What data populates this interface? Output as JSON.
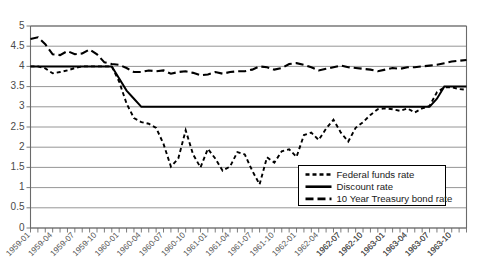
{
  "chart_data": {
    "type": "line",
    "title": "",
    "subtitle": "",
    "xlabel": "",
    "ylabel": "",
    "grid": true,
    "legend_position": "bottom-right",
    "ylim": [
      0,
      5
    ],
    "ytick_labels": [
      "0",
      "0.5",
      "1",
      "1.5",
      "2",
      "2.5",
      "3",
      "3.5",
      "4",
      "4.5",
      "5"
    ],
    "ytick_values": [
      0,
      0.5,
      1,
      1.5,
      2,
      2.5,
      3,
      3.5,
      4,
      4.5,
      5
    ],
    "x": [
      "1959-01",
      "1959-02",
      "1959-03",
      "1959-04",
      "1959-05",
      "1959-06",
      "1959-07",
      "1959-08",
      "1959-09",
      "1959-10",
      "1959-11",
      "1959-12",
      "1960-01",
      "1960-02",
      "1960-03",
      "1960-04",
      "1960-05",
      "1960-06",
      "1960-07",
      "1960-08",
      "1960-09",
      "1960-10",
      "1960-11",
      "1960-12",
      "1961-01",
      "1961-02",
      "1961-03",
      "1961-04",
      "1961-05",
      "1961-06",
      "1961-07",
      "1961-08",
      "1961-09",
      "1961-10",
      "1961-11",
      "1961-12",
      "1962-01",
      "1962-02",
      "1962-03",
      "1962-04",
      "1962-05",
      "1962-06",
      "1962-07",
      "1962-08",
      "1962-09",
      "1962-10",
      "1962-11",
      "1962-12",
      "1963-01",
      "1963-02",
      "1963-03",
      "1963-04",
      "1963-05",
      "1963-06",
      "1963-07",
      "1963-08",
      "1963-09",
      "1963-10",
      "1963-11",
      "1963-12"
    ],
    "xtick_labels": [
      "1959-01",
      "1959-04",
      "1959-07",
      "1959-10",
      "1960-01",
      "1960-04",
      "1960-07",
      "1960-10",
      "1961-01",
      "1961-04",
      "1961-07",
      "1961-10",
      "1962-01",
      "1962-04",
      "1962-07",
      "1962-10",
      "1963-01",
      "1963-04",
      "1963-07",
      "1963-10",
      "1962-07",
      "1962-10",
      "1963-01",
      "1963-04",
      "1963-07",
      "1963-10"
    ],
    "xtick_indices": [
      0,
      3,
      6,
      9,
      12,
      15,
      18,
      21,
      24,
      27,
      30,
      33,
      36,
      39,
      42,
      45,
      48,
      51,
      54,
      57,
      42,
      45,
      48,
      51,
      54,
      57
    ],
    "series": [
      {
        "name": "Federal funds rate",
        "dash": "short",
        "dash_pattern": "4,3",
        "width": 1.9,
        "values": [
          4.0,
          4.0,
          3.95,
          3.83,
          3.86,
          3.9,
          3.96,
          4.0,
          4.0,
          4.0,
          4.0,
          4.0,
          3.62,
          3.08,
          2.72,
          2.62,
          2.58,
          2.48,
          2.08,
          1.52,
          1.72,
          2.42,
          1.82,
          1.5,
          1.96,
          1.72,
          1.42,
          1.52,
          1.88,
          1.82,
          1.42,
          1.08,
          1.75,
          1.62,
          1.9,
          1.95,
          1.76,
          2.3,
          2.36,
          2.18,
          2.46,
          2.68,
          2.36,
          2.14,
          2.48,
          2.62,
          2.8,
          2.94,
          2.96,
          2.94,
          2.9,
          2.96,
          2.86,
          2.96,
          3.02,
          3.36,
          3.48,
          3.48,
          3.44,
          3.42
        ]
      },
      {
        "name": "Discount rate",
        "dash": "solid",
        "dash_pattern": "",
        "width": 2.0,
        "values": [
          4.0,
          4.0,
          4.0,
          4.0,
          4.0,
          4.0,
          4.0,
          4.0,
          4.0,
          4.0,
          4.0,
          4.0,
          3.7,
          3.4,
          3.2,
          3.0,
          3.0,
          3.0,
          3.0,
          3.0,
          3.0,
          3.0,
          3.0,
          3.0,
          3.0,
          3.0,
          3.0,
          3.0,
          3.0,
          3.0,
          3.0,
          3.0,
          3.0,
          3.0,
          3.0,
          3.0,
          3.0,
          3.0,
          3.0,
          3.0,
          3.0,
          3.0,
          3.0,
          3.0,
          3.0,
          3.0,
          3.0,
          3.0,
          3.0,
          3.0,
          3.0,
          3.0,
          3.0,
          3.0,
          3.0,
          3.2,
          3.5,
          3.5,
          3.5,
          3.5
        ]
      },
      {
        "name": "10 Year Treasury bond rate",
        "dash": "long",
        "dash_pattern": "8,4",
        "width": 2.1,
        "values": [
          4.68,
          4.72,
          4.55,
          4.3,
          4.28,
          4.38,
          4.3,
          4.32,
          4.42,
          4.3,
          4.1,
          4.06,
          4.04,
          3.96,
          3.86,
          3.86,
          3.9,
          3.88,
          3.9,
          3.82,
          3.86,
          3.88,
          3.84,
          3.78,
          3.8,
          3.86,
          3.82,
          3.86,
          3.88,
          3.88,
          3.92,
          4.0,
          3.98,
          3.92,
          3.96,
          4.06,
          4.08,
          4.04,
          3.98,
          3.9,
          3.94,
          3.98,
          4.02,
          3.98,
          3.96,
          3.94,
          3.92,
          3.88,
          3.92,
          3.96,
          3.94,
          3.98,
          3.98,
          4.0,
          4.02,
          4.04,
          4.08,
          4.12,
          4.14,
          4.16
        ]
      }
    ]
  },
  "legend": {
    "entries": [
      {
        "label": "Federal funds rate"
      },
      {
        "label": "Discount rate"
      },
      {
        "label": "10 Year Treasury bond rate"
      }
    ]
  }
}
